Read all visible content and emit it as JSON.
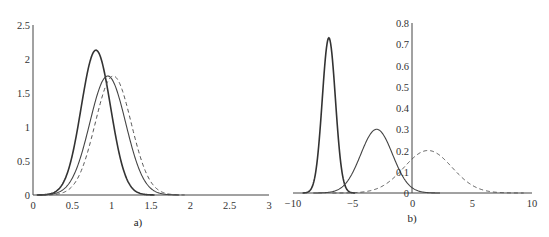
{
  "chart_data": [
    {
      "type": "line",
      "caption": "a)",
      "title": "",
      "xlabel": "",
      "ylabel": "",
      "xlim": [
        0,
        3
      ],
      "ylim": [
        0,
        2.5
      ],
      "x_ticks": [
        "0",
        "0.5",
        "1",
        "1.5",
        "2",
        "2.5",
        "3"
      ],
      "y_ticks": [
        "0",
        "0.5",
        "1",
        "1.5",
        "2",
        "2.5"
      ],
      "grid": false,
      "legend": null,
      "series": [
        {
          "name": "thick solid",
          "style": "solid-thick",
          "shape": "gaussian",
          "mean": 0.8,
          "sd": 0.187,
          "peak": 2.13
        },
        {
          "name": "thin solid",
          "style": "solid-thin",
          "shape": "gaussian",
          "mean": 0.95,
          "sd": 0.228,
          "peak": 1.75
        },
        {
          "name": "dashed",
          "style": "dashed",
          "shape": "gaussian",
          "mean": 1.02,
          "sd": 0.228,
          "peak": 1.75
        }
      ]
    },
    {
      "type": "line",
      "caption": "b)",
      "title": "",
      "xlabel": "",
      "ylabel": "",
      "xlim": [
        -10,
        10
      ],
      "ylim": [
        0,
        0.8
      ],
      "x_ticks": [
        "-10",
        "-5",
        "0",
        "5",
        "10"
      ],
      "y_ticks": [
        "0",
        "0.1",
        "0.2",
        "0.3",
        "0.4",
        "0.5",
        "0.6",
        "0.7",
        "0.8"
      ],
      "grid": false,
      "legend": null,
      "series": [
        {
          "name": "thick solid",
          "style": "solid-thick",
          "shape": "gaussian",
          "mean": -7.0,
          "sd": 0.55,
          "peak": 0.73
        },
        {
          "name": "thin solid",
          "style": "solid-thin",
          "shape": "gaussian",
          "mean": -3.0,
          "sd": 1.33,
          "peak": 0.3
        },
        {
          "name": "dashed",
          "style": "dashed",
          "shape": "gaussian",
          "mean": 1.3,
          "sd": 2.0,
          "peak": 0.2
        }
      ]
    }
  ]
}
